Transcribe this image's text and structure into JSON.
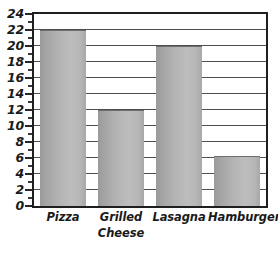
{
  "chart_data": {
    "type": "bar",
    "title": "",
    "subtitle": "",
    "xlabel": "",
    "ylabel": "",
    "categories": [
      "Pizza",
      "Grilled Cheese",
      "Lasagna",
      "Hamburger"
    ],
    "category_lines": [
      [
        "Pizza"
      ],
      [
        "Grilled",
        "Cheese"
      ],
      [
        "Lasagna"
      ],
      [
        "Hamburger"
      ]
    ],
    "values": [
      22,
      12,
      20,
      6.3
    ],
    "ylim": [
      0,
      24
    ],
    "y_major_step": 2,
    "y_minor_step": 1,
    "y_tick_labels": [
      "24",
      "22",
      "20",
      "18",
      "16",
      "14",
      "12",
      "10",
      "8",
      "6",
      "4",
      "2",
      "0"
    ],
    "y_tick_values": [
      24,
      22,
      20,
      18,
      16,
      14,
      12,
      10,
      8,
      6,
      4,
      2,
      0
    ],
    "y_minor_tick_values": [
      23,
      21,
      19,
      17,
      15,
      13,
      11,
      9,
      7,
      5,
      3,
      1
    ],
    "grid": true,
    "grid_axis": "y",
    "grid_values": [
      2,
      4,
      6,
      8,
      10,
      12,
      14,
      16,
      18,
      20,
      22
    ],
    "legend": false,
    "legend_position": "none",
    "bar_fill_left": "#9a9a9a",
    "bar_fill_right": "#bdbdbd",
    "axis_color": "#1f1f1f",
    "grid_color": "#4d4d4d",
    "text_color": "#1a1a1a",
    "background": "#ffffff"
  }
}
